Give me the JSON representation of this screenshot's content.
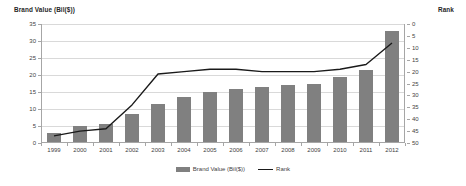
{
  "chart_data": {
    "type": "bar",
    "title": "",
    "xlabel": "",
    "ylabel": "Brand Value (Bil($))",
    "y2label": "Rank",
    "categories": [
      "1999",
      "2000",
      "2001",
      "2002",
      "2003",
      "2004",
      "2005",
      "2006",
      "2007",
      "2008",
      "2009",
      "2010",
      "2011",
      "2012"
    ],
    "ylim": [
      0,
      35
    ],
    "yticks": [
      0,
      5,
      10,
      15,
      20,
      25,
      30,
      35
    ],
    "y2lim": [
      0,
      50
    ],
    "y2ticks": [
      0,
      5,
      10,
      15,
      20,
      25,
      30,
      35,
      40,
      45,
      50
    ],
    "y2_reversed": true,
    "grid": true,
    "legend_position": "bottom",
    "series": [
      {
        "name": "Brand Value (Bil($))",
        "type": "bar",
        "axis": "left",
        "color": "#808080",
        "values": [
          3.0,
          5.0,
          5.5,
          8.5,
          11.5,
          13.5,
          15.0,
          16.0,
          16.5,
          17.0,
          17.5,
          19.5,
          21.5,
          33.0
        ]
      },
      {
        "name": "Rank",
        "type": "line",
        "axis": "right",
        "color": "#1a1a1a",
        "values": [
          47,
          45,
          44,
          34,
          21,
          20,
          19,
          19,
          20,
          20,
          20,
          19,
          17,
          8
        ]
      }
    ]
  },
  "axes": {
    "left_title": "Brand Value (Bil($))",
    "right_title": "Rank"
  },
  "legend": {
    "items": [
      {
        "label": "Brand Value (Bil($))",
        "marker": "bar-swatch"
      },
      {
        "label": "Rank",
        "marker": "line-swatch"
      }
    ]
  },
  "colors": {
    "bar": "#808080",
    "line": "#1a1a1a",
    "grid": "#d9d9d9",
    "axis": "#a6a6a6",
    "text": "#3f3f3f",
    "background": "#ffffff"
  }
}
